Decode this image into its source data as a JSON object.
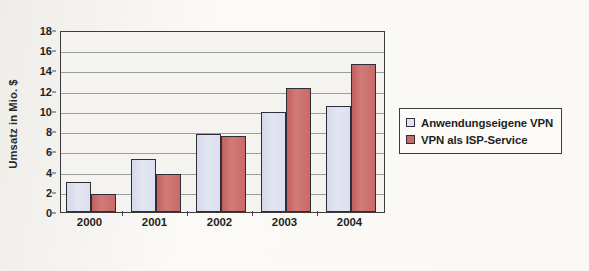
{
  "chart_data": {
    "type": "bar",
    "title": "",
    "xlabel": "",
    "ylabel": "Umsatz in Mio. $",
    "categories": [
      "2000",
      "2001",
      "2002",
      "2003",
      "2004"
    ],
    "series": [
      {
        "name": "Anwendungseigene VPN",
        "color": "#e0e3f0",
        "values": [
          3.0,
          5.2,
          7.7,
          9.9,
          10.5
        ]
      },
      {
        "name": "VPN als ISP-Service",
        "color": "#c96a68",
        "values": [
          1.8,
          3.8,
          7.5,
          12.3,
          14.6
        ]
      }
    ],
    "ylim": [
      0,
      18
    ],
    "ytick_values": [
      0,
      2,
      4,
      6,
      8,
      10,
      12,
      14,
      16,
      18
    ],
    "ytick_labels": [
      "0",
      "2",
      "4",
      "6",
      "8",
      "10",
      "12",
      "14",
      "16",
      "18"
    ],
    "grid": true,
    "grid_axis": "y",
    "legend_position": "right",
    "plot_background": "#f4f3ef",
    "axis_color": "#3b3b3b",
    "gridline_color": "#8d8d8d"
  },
  "legend": {
    "items": [
      {
        "label": "Anwendungseigene VPN"
      },
      {
        "label": "VPN als ISP-Service"
      }
    ]
  }
}
